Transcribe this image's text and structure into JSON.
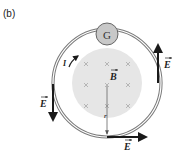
{
  "figure": {
    "panel_label": "(b)",
    "galvanometer_label": "G",
    "field_label": "B",
    "current_label": "I",
    "radius_label": "r",
    "electric_field_labels": [
      "E",
      "E",
      "E"
    ]
  },
  "colors": {
    "ring": "#777777",
    "field_region": "#e6e6e6",
    "arrow": "#1a1a1a",
    "galvanometer_fill": "#c8c8c8",
    "cross_marks": "#a0a0a0"
  }
}
